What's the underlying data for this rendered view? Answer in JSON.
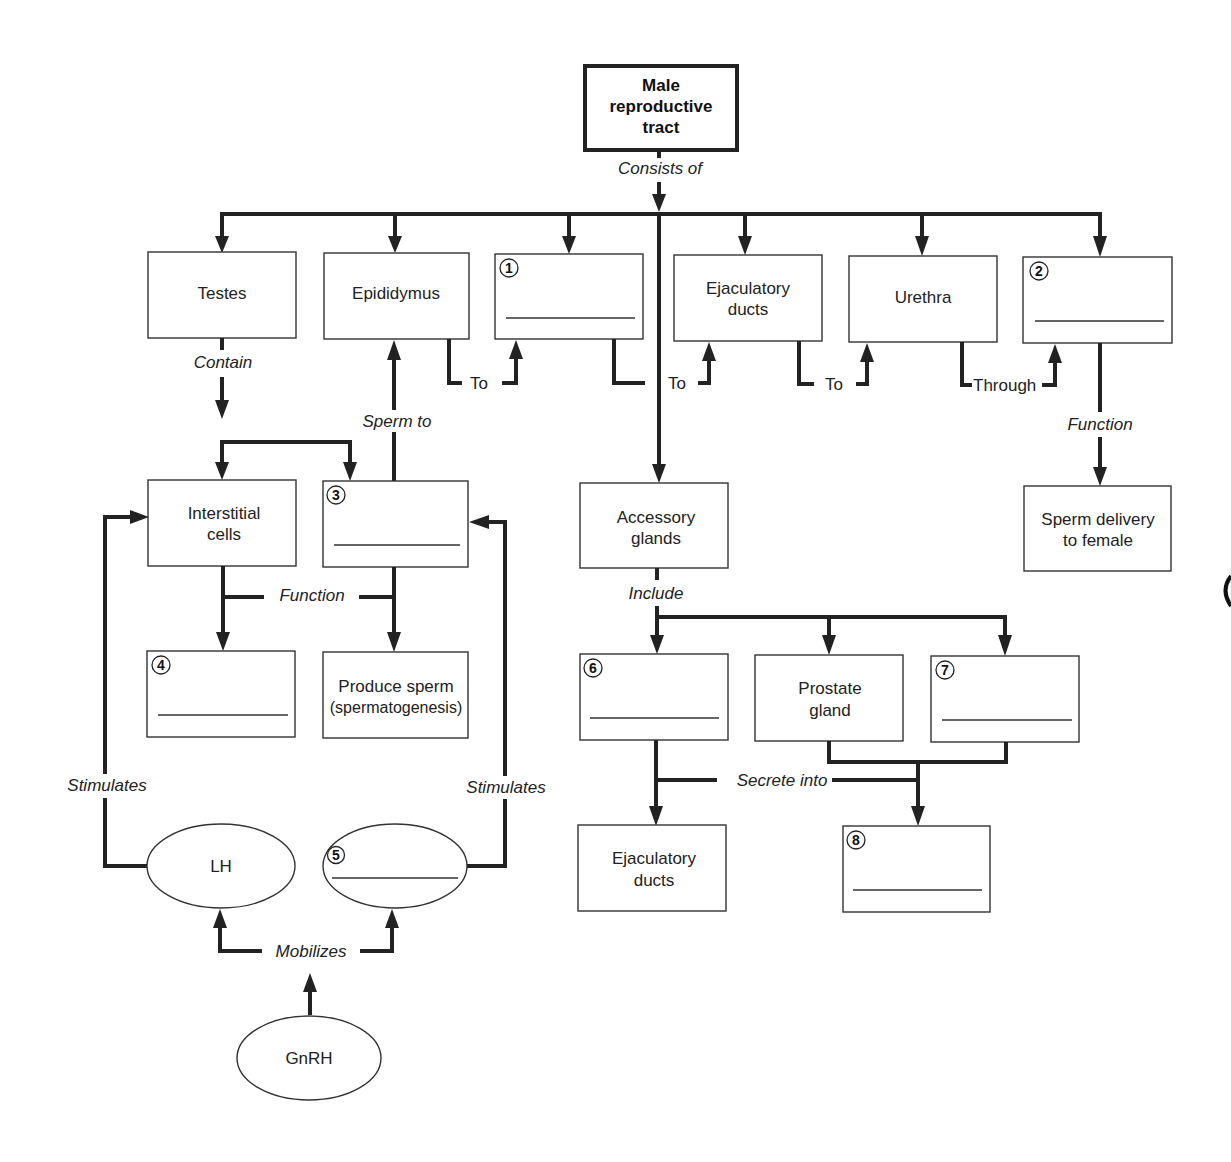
{
  "diagram": {
    "root": {
      "line1": "Male",
      "line2": "reproductive",
      "line3": "tract"
    },
    "links": {
      "consists_of": "Consists of",
      "contain": "Contain",
      "sperm_to": "Sperm to",
      "to_1": "To",
      "to_2": "To",
      "to_3": "To",
      "through": "Through",
      "function_left": "Function",
      "function_right": "Function",
      "include": "Include",
      "secrete_into": "Secrete into",
      "stimulates_left": "Stimulates",
      "stimulates_right": "Stimulates",
      "mobilizes": "Mobilizes"
    },
    "nodes": {
      "testes": "Testes",
      "epididymus": "Epididymus",
      "blank1": {
        "number": "1",
        "value": ""
      },
      "ejaculatory_ducts_top": {
        "line1": "Ejaculatory",
        "line2": "ducts"
      },
      "urethra": "Urethra",
      "blank2": {
        "number": "2",
        "value": ""
      },
      "interstitial_cells": {
        "line1": "Interstitial",
        "line2": "cells"
      },
      "blank3": {
        "number": "3",
        "value": ""
      },
      "blank4": {
        "number": "4",
        "value": ""
      },
      "produce_sperm": {
        "line1": "Produce sperm",
        "line2": "(spermatogenesis)"
      },
      "accessory_glands": {
        "line1": "Accessory",
        "line2": "glands"
      },
      "sperm_delivery": {
        "line1": "Sperm delivery",
        "line2": "to female"
      },
      "blank6": {
        "number": "6",
        "value": ""
      },
      "prostate_gland": {
        "line1": "Prostate",
        "line2": "gland"
      },
      "blank7": {
        "number": "7",
        "value": ""
      },
      "ejaculatory_ducts_bottom": {
        "line1": "Ejaculatory",
        "line2": "ducts"
      },
      "blank8": {
        "number": "8",
        "value": ""
      },
      "lh": "LH",
      "blank5": {
        "number": "5",
        "value": ""
      },
      "gnrh": "GnRH"
    }
  }
}
